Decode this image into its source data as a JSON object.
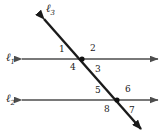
{
  "figure": {
    "width": 165,
    "height": 135,
    "background": "#ffffff",
    "stroke_color": "#4d4d4d",
    "transversal_color": "#1a1a1a",
    "label_color": "#1a1a1a"
  },
  "lines": {
    "l1": {
      "name": "ℓ",
      "subscript": "1",
      "label_x": 6,
      "label_y": 52,
      "y": 59,
      "x_start": 22,
      "x_end": 158,
      "arrows": "both"
    },
    "l2": {
      "name": "ℓ",
      "subscript": "2",
      "label_x": 6,
      "label_y": 93,
      "y": 100,
      "x_start": 22,
      "x_end": 158,
      "arrows": "both"
    },
    "l3": {
      "name": "ℓ",
      "subscript": "3",
      "label_x": 46,
      "label_y": 3,
      "x_start": 44,
      "y_start": 19,
      "x_end": 141,
      "y_end": 129,
      "arrows": "both"
    }
  },
  "intersections": [
    {
      "name": "upper-intersection",
      "x": 82,
      "y": 59
    },
    {
      "name": "lower-intersection",
      "x": 117,
      "y": 100
    }
  ],
  "angles": [
    {
      "id": "1",
      "label": "1",
      "x": 59,
      "y": 45,
      "position": "upper-left-of-upper-intersection"
    },
    {
      "id": "2",
      "label": "2",
      "x": 90,
      "y": 44,
      "position": "upper-right-of-upper-intersection"
    },
    {
      "id": "3",
      "label": "3",
      "x": 95,
      "y": 65,
      "position": "lower-right-of-upper-intersection"
    },
    {
      "id": "4",
      "label": "4",
      "x": 70,
      "y": 63,
      "position": "lower-left-of-upper-intersection"
    },
    {
      "id": "5",
      "label": "5",
      "x": 95,
      "y": 86,
      "position": "upper-left-of-lower-intersection"
    },
    {
      "id": "6",
      "label": "6",
      "x": 125,
      "y": 85,
      "position": "upper-right-of-lower-intersection"
    },
    {
      "id": "7",
      "label": "7",
      "x": 129,
      "y": 106,
      "position": "lower-right-of-lower-intersection"
    },
    {
      "id": "8",
      "label": "8",
      "x": 104,
      "y": 105,
      "position": "lower-left-of-lower-intersection"
    }
  ]
}
